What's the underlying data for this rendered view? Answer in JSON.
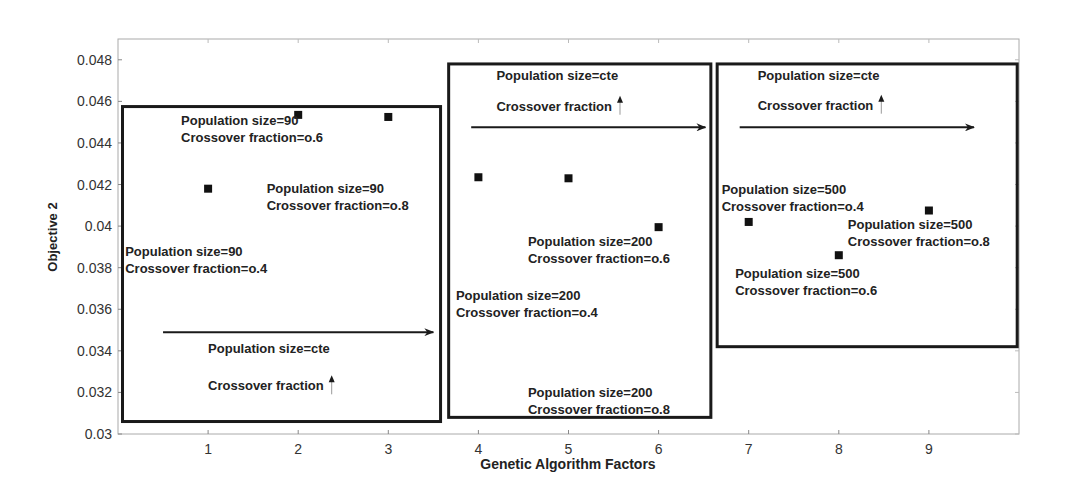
{
  "chart_data": {
    "type": "scatter",
    "title": "",
    "xlabel": "Genetic Algorithm Factors",
    "ylabel": "Objective 2",
    "xlim": [
      0,
      10
    ],
    "ylim": [
      0.03,
      0.049
    ],
    "x_ticks": [
      1,
      2,
      3,
      4,
      5,
      6,
      7,
      8,
      9
    ],
    "y_ticks": [
      0.03,
      0.032,
      0.034,
      0.036,
      0.038,
      0.04,
      0.042,
      0.044,
      0.046,
      0.048
    ],
    "y_tick_labels": [
      "0.03",
      "0.032",
      "0.034",
      "0.036",
      "0.038",
      "0.04",
      "0.042",
      "0.044",
      "0.046",
      "0.048"
    ],
    "grid": false,
    "legend": null,
    "marker": "square",
    "series": [
      {
        "name": "Objective 2",
        "points": [
          {
            "x": 1,
            "y": 0.0418,
            "population_size": 90,
            "crossover_fraction": 0.4
          },
          {
            "x": 2,
            "y": 0.04535,
            "population_size": 90,
            "crossover_fraction": 0.6
          },
          {
            "x": 3,
            "y": 0.04525,
            "population_size": 90,
            "crossover_fraction": 0.8
          },
          {
            "x": 4,
            "y": 0.04235,
            "population_size": 200,
            "crossover_fraction": 0.4
          },
          {
            "x": 5,
            "y": 0.0423,
            "population_size": 200,
            "crossover_fraction": 0.6
          },
          {
            "x": 6,
            "y": 0.03995,
            "population_size": 200,
            "crossover_fraction": 0.8
          },
          {
            "x": 7,
            "y": 0.0402,
            "population_size": 500,
            "crossover_fraction": 0.4
          },
          {
            "x": 8,
            "y": 0.0386,
            "population_size": 500,
            "crossover_fraction": 0.6
          },
          {
            "x": 9,
            "y": 0.04075,
            "population_size": 500,
            "crossover_fraction": 0.8
          }
        ]
      }
    ],
    "groups": [
      {
        "name": "group-population-90",
        "box": {
          "x0": 0.05,
          "x1": 3.58,
          "y0": 0.0306,
          "y1": 0.04575
        },
        "arrow": {
          "x0": 0.5,
          "x1": 3.5,
          "y": 0.0349
        },
        "labels": [
          {
            "lines": [
              "Population size=90",
              "Crossover fraction=o.6"
            ],
            "x": 0.7,
            "y": 0.04485
          },
          {
            "lines": [
              "Population size=90",
              "Crossover fraction=o.8"
            ],
            "x": 1.65,
            "y": 0.0416
          },
          {
            "lines": [
              "Population size=90",
              "Crossover fraction=o.4"
            ],
            "x": 0.08,
            "y": 0.03855
          }
        ],
        "trend_labels": {
          "line1": "Population size=cte",
          "line2": "Crossover fraction",
          "x": 1.0,
          "y1": 0.0339,
          "y2": 0.0321
        }
      },
      {
        "name": "group-population-200",
        "box": {
          "x0": 3.67,
          "x1": 6.58,
          "y0": 0.0308,
          "y1": 0.0478
        },
        "arrow": {
          "x0": 3.92,
          "x1": 6.52,
          "y": 0.04475
        },
        "labels": [
          {
            "lines": [
              "Population size=200",
              "Crossover fraction=o.6"
            ],
            "x": 4.55,
            "y": 0.03905
          },
          {
            "lines": [
              "Population size=200",
              "Crossover fraction=o.4"
            ],
            "x": 3.75,
            "y": 0.03645
          },
          {
            "lines": [
              "Population size=200",
              "Crossover fraction=o.8"
            ],
            "x": 4.55,
            "y": 0.0318
          }
        ],
        "trend_labels": {
          "line1": "Population size=cte",
          "line2": "Crossover fraction",
          "x": 4.2,
          "y1": 0.04705,
          "y2": 0.04555
        }
      },
      {
        "name": "group-population-500",
        "box": {
          "x0": 6.65,
          "x1": 9.98,
          "y0": 0.0342,
          "y1": 0.0478
        },
        "arrow": {
          "x0": 6.9,
          "x1": 9.5,
          "y": 0.04475
        },
        "labels": [
          {
            "lines": [
              "Population size=500",
              "Crossover fraction=o.4"
            ],
            "x": 6.7,
            "y": 0.04155
          },
          {
            "lines": [
              "Population size=500",
              "Crossover fraction=o.8"
            ],
            "x": 8.1,
            "y": 0.03985
          },
          {
            "lines": [
              "Population size=500",
              "Crossover fraction=o.6"
            ],
            "x": 6.85,
            "y": 0.0375
          }
        ],
        "trend_labels": {
          "line1": "Population size=cte",
          "line2": "Crossover fraction",
          "x": 7.1,
          "y1": 0.04705,
          "y2": 0.0456
        }
      }
    ]
  },
  "plot_area": {
    "left": 118,
    "right": 1019,
    "top": 39,
    "bottom": 434
  },
  "colors": {
    "axis": "#888888",
    "box": "#1a1a1a",
    "text": "#222222",
    "marker": "#111111"
  }
}
